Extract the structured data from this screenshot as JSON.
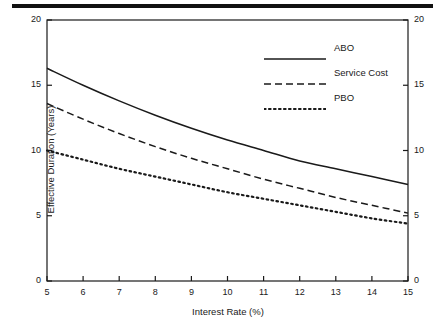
{
  "figure": {
    "top_rule": "decorative-rule"
  },
  "chart_data": {
    "type": "line",
    "title": "",
    "subtitle": "",
    "xlabel": "Interest Rate (%)",
    "ylabel": "Effective Duration (Years)",
    "xlim": [
      5,
      15
    ],
    "ylim": [
      0,
      20
    ],
    "xticks": [
      "5",
      "6",
      "7",
      "8",
      "9",
      "10",
      "11",
      "12",
      "13",
      "14",
      "15"
    ],
    "yticks": [
      "0",
      "5",
      "10",
      "15",
      "20"
    ],
    "yticks_right": [
      "0",
      "5",
      "10",
      "15",
      "20"
    ],
    "grid": false,
    "legend_position": "top-right",
    "x": [
      5,
      6,
      7,
      8,
      9,
      10,
      11,
      12,
      13,
      14,
      15
    ],
    "series": [
      {
        "name": "ABO",
        "style": "solid",
        "color": "#1a1a1a",
        "values": [
          16.3,
          15.0,
          13.8,
          12.7,
          11.7,
          10.8,
          10.0,
          9.2,
          8.6,
          8.0,
          7.4
        ]
      },
      {
        "name": "Service Cost",
        "style": "dashed",
        "color": "#1a1a1a",
        "values": [
          13.6,
          12.4,
          11.3,
          10.3,
          9.4,
          8.6,
          7.8,
          7.1,
          6.4,
          5.8,
          5.2
        ]
      },
      {
        "name": "PBO",
        "style": "dotted",
        "color": "#1a1a1a",
        "values": [
          10.0,
          9.3,
          8.6,
          8.0,
          7.4,
          6.8,
          6.3,
          5.8,
          5.3,
          4.8,
          4.4
        ]
      }
    ]
  },
  "legend": {
    "items": [
      {
        "label": "ABO",
        "style": "solid"
      },
      {
        "label": "Service Cost",
        "style": "dashed"
      },
      {
        "label": "PBO",
        "style": "dotted"
      }
    ]
  }
}
